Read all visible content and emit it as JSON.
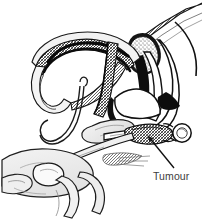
{
  "figure": {
    "type": "medical-line-illustration",
    "background_color": "#ffffff",
    "ink_color": "#000000",
    "label_color": "#3d3d3d",
    "shade_light": "#d9d9d9",
    "shade_mid": "#9a9a9a",
    "shade_dark": "#4a4a4a",
    "width": 202,
    "height": 223
  },
  "annotations": [
    {
      "id": "tumour-label",
      "text": "Tumour",
      "x": 153,
      "y": 180,
      "leader": {
        "from_x": 174,
        "from_y": 168,
        "to_x": 146,
        "to_y": 132,
        "arrowhead": "at-mass"
      }
    }
  ],
  "structures": [
    {
      "name": "epididymis-loop",
      "shading": "cross-hatch"
    },
    {
      "name": "vas-deferens",
      "shading": "outline"
    },
    {
      "name": "stippled-mass",
      "shading": "stipple"
    },
    {
      "name": "inguinal-canal-wall",
      "shading": "outline"
    },
    {
      "name": "spermatic-cord",
      "shading": "outline"
    },
    {
      "name": "tumour-mass",
      "shading": "cross-hatch"
    },
    {
      "name": "testis",
      "shading": "outline"
    },
    {
      "name": "surgeon-hand",
      "shading": "light-wash"
    },
    {
      "name": "retracted-tissue-flap",
      "shading": "light-wash"
    }
  ]
}
